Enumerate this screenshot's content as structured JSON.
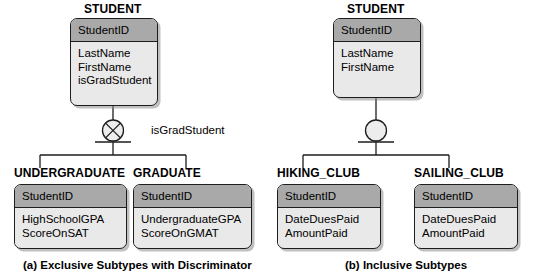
{
  "figure": {
    "panels": [
      {
        "id": "panel-a",
        "caption": "(a) Exclusive Subtypes with Discriminator",
        "supertype": {
          "title": "STUDENT",
          "key_attribute": "StudentID",
          "attributes": [
            "LastName",
            "FirstName",
            "isGradStudent"
          ]
        },
        "connector": {
          "symbol": "exclusive-circle-x",
          "discriminator_label": "isGradStudent"
        },
        "subtypes": [
          {
            "title": "UNDERGRADUATE",
            "key_attribute": "StudentID",
            "attributes": [
              "HighSchoolGPA",
              "ScoreOnSAT"
            ]
          },
          {
            "title": "GRADUATE",
            "key_attribute": "StudentID",
            "attributes": [
              "UndergraduateGPA",
              "ScoreOnGMAT"
            ]
          }
        ]
      },
      {
        "id": "panel-b",
        "caption": "(b) Inclusive Subtypes",
        "supertype": {
          "title": "STUDENT",
          "key_attribute": "StudentID",
          "attributes": [
            "LastName",
            "FirstName"
          ]
        },
        "connector": {
          "symbol": "inclusive-circle",
          "discriminator_label": ""
        },
        "subtypes": [
          {
            "title": "HIKING_CLUB",
            "key_attribute": "StudentID",
            "attributes": [
              "DateDuesPaid",
              "AmountPaid"
            ]
          },
          {
            "title": "SAILING_CLUB",
            "key_attribute": "StudentID",
            "attributes": [
              "DateDuesPaid",
              "AmountPaid"
            ]
          }
        ]
      }
    ],
    "colors": {
      "header_fill": "#a9a9a9",
      "body_fill": "#e9e9e9",
      "outline": "#1d1d1d",
      "background": "#ffffff"
    }
  }
}
